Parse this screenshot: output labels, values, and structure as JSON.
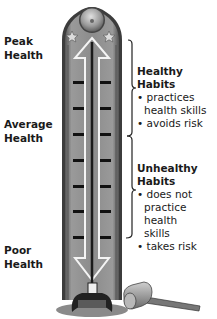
{
  "left_labels": {
    "peak": "Peak Health",
    "peak_lines": [
      "Peak",
      "Health"
    ],
    "average_lines": [
      "Average",
      "Health"
    ],
    "poor_lines": [
      "Poor",
      "Health"
    ]
  },
  "healthy": {
    "title": "Healthy Habits",
    "bullets": [
      [
        "practices",
        "health skills"
      ],
      [
        "avoids risk"
      ]
    ]
  },
  "unhealthy": {
    "title_lines": [
      "Unhealthy",
      "Habits"
    ],
    "bullets": [
      [
        "does not",
        "practice health",
        "skills"
      ],
      [
        "takes risk"
      ]
    ]
  },
  "colors": {
    "column_fill": "#8a8a8a",
    "column_dark": "#3a3a3a",
    "arrow_outline": "#f2f2f2",
    "tick": "#111111",
    "bell": "#a8a8a8"
  },
  "icons": [
    "bell-icon",
    "star-icon",
    "star-icon",
    "double-arrow-icon",
    "mallet-icon",
    "striker-base-icon"
  ]
}
